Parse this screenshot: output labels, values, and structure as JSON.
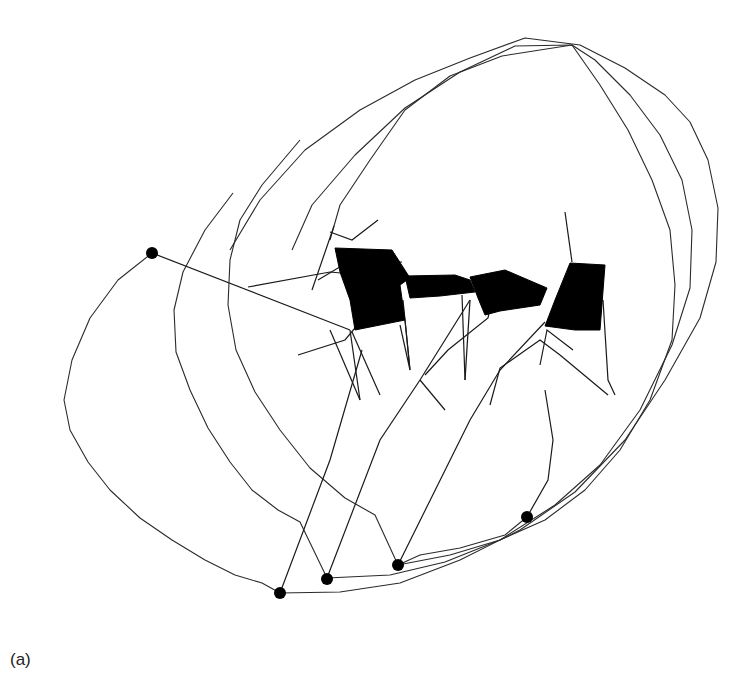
{
  "figure": {
    "panel_label": "(a)",
    "colors": {
      "line": "#2a2a2a",
      "fill": "#000000",
      "background": "#ffffff"
    },
    "trajectory_arcs": [
      {
        "name": "outer-left-arc",
        "points": "152,253 118,280 90,318 72,360 64,400 70,430 88,462 110,490 140,518 172,540 205,560 235,575 262,583 280,593"
      },
      {
        "name": "second-arc",
        "points": "233,193 205,230 183,272 174,310 176,352 190,390 208,428 230,462 252,490 278,510 300,522 327,578"
      },
      {
        "name": "third-arc",
        "points": "300,140 262,185 240,220 230,260 228,305 236,350 255,392 280,430 310,468 345,498 375,515 398,565"
      },
      {
        "name": "outer-loop-1",
        "points": "280,593 340,592 400,583 460,560 520,530 575,492 625,440 665,380 700,318 716,262 718,208 708,160 690,122 665,95 625,68 580,45 525,38 470,58 415,80 360,110 305,150 260,200 230,250"
      },
      {
        "name": "outer-loop-2",
        "points": "327,578 390,575 445,562 500,540 555,505 600,465 640,410 672,345 690,288 692,230 682,180 660,135 630,95 595,60 572,45 515,46 460,72 405,108 355,155 312,205 292,250"
      },
      {
        "name": "outer-loop-3",
        "points": "398,565 450,555 500,540 545,520 585,490 620,450 650,400 672,340 675,285 670,230 652,180 628,130 600,85 572,45 502,56 450,76 405,110 370,160 340,205 330,240"
      },
      {
        "name": "end-trace-4",
        "points": "527,517 505,535 460,548 420,555 398,565"
      }
    ],
    "limb_segments": [
      "152,253 350,330",
      "248,287 330,272 395,278",
      "318,280 348,262 402,262",
      "330,232 352,240 378,220",
      "334,226 312,290",
      "298,355 345,340 360,322",
      "350,330 360,400",
      "352,332 380,395",
      "280,593 330,460 362,350",
      "360,400 330,330",
      "400,325 410,370 403,300",
      "410,370 405,320",
      "327,578 380,440 420,380 470,300",
      "420,380 445,410",
      "470,300 465,380",
      "465,380 462,295",
      "425,375 448,350 488,318 492,300",
      "398,565 470,420 500,370 545,322",
      "490,405 500,368 540,340 560,355",
      "560,355 608,395",
      "603,300 608,380 615,395",
      "540,365 547,330 573,350",
      "565,212 572,262",
      "527,517 548,480 553,440 545,390"
    ],
    "body_segments": [
      {
        "name": "segment-1",
        "points": "335,248 392,250 410,278 400,285 405,320 355,330 350,300 340,272"
      },
      {
        "name": "segment-2",
        "points": "405,276 455,275 470,280 475,292 440,296 410,298"
      },
      {
        "name": "segment-3",
        "points": "470,277 505,270 547,288 540,305 500,311 485,315 478,298"
      },
      {
        "name": "segment-4",
        "points": "570,263 605,265 600,330 575,330 545,326 555,300"
      }
    ],
    "markers": [
      {
        "cx": 152,
        "cy": 253,
        "r": 6
      },
      {
        "cx": 280,
        "cy": 593,
        "r": 6
      },
      {
        "cx": 327,
        "cy": 579,
        "r": 6
      },
      {
        "cx": 398,
        "cy": 565,
        "r": 6
      },
      {
        "cx": 527,
        "cy": 517,
        "r": 6
      }
    ]
  }
}
